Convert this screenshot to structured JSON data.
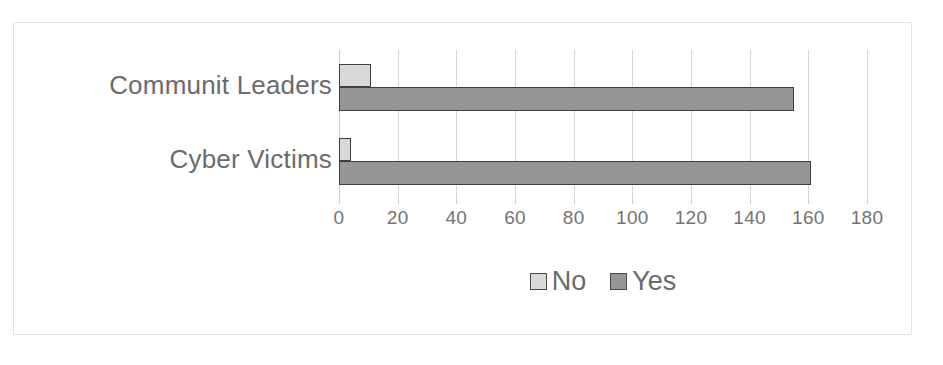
{
  "chart_data": {
    "type": "bar",
    "orientation": "horizontal",
    "title": "",
    "subtitle": "",
    "xlabel": "",
    "ylabel": "",
    "categories": [
      "Communit Leaders",
      "Cyber Victims"
    ],
    "series": [
      {
        "name": "No",
        "values": [
          11,
          4
        ],
        "color": "#d9d9d9"
      },
      {
        "name": "Yes",
        "values": [
          155,
          161
        ],
        "color": "#969696"
      }
    ],
    "xlim": [
      0,
      180
    ],
    "xticks": [
      0,
      20,
      40,
      60,
      80,
      100,
      120,
      140,
      160,
      180
    ],
    "xtick_labels": [
      "0",
      "20",
      "40",
      "60",
      "80",
      "100",
      "120",
      "140",
      "160",
      "180"
    ],
    "tick_step": 20,
    "grid": true,
    "grid_axis": "x",
    "legend": true,
    "legend_position": "bottom",
    "legend_entries": [
      "No",
      "Yes"
    ],
    "bar_border_color": "#3f3f3f",
    "grid_color": "#d6d6d6",
    "frame_color": "#e3e3e3",
    "text_color": "#6b6b6b"
  }
}
